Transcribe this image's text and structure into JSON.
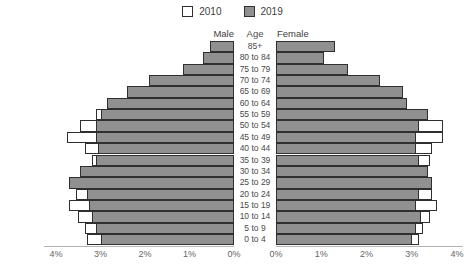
{
  "chart_data": {
    "type": "bar",
    "subtype": "population-pyramid",
    "title": "",
    "unit": "percent of total population",
    "legend": [
      {
        "label": "2010",
        "fill": "#ffffff"
      },
      {
        "label": "2019",
        "fill": "#909090"
      }
    ],
    "column_headers": {
      "male": "Male",
      "age": "Age",
      "female": "Female"
    },
    "categories": [
      "85+",
      "80 to 84",
      "75 to 79",
      "70 to 74",
      "65 to 69",
      "60 to 64",
      "55 to 59",
      "50 to 54",
      "45 to 49",
      "40 to 44",
      "35 to 39",
      "30 to 34",
      "25 to 29",
      "20 to 24",
      "15 to 19",
      "10 to 14",
      "5 to 9",
      "0 to 4"
    ],
    "xlim": [
      0,
      4
    ],
    "male_axis_ticks": [
      "4%",
      "3%",
      "2%",
      "1%",
      "0%"
    ],
    "female_axis_ticks": [
      "0%",
      "1%",
      "2%",
      "3%",
      "4%"
    ],
    "series": [
      {
        "name": "Male 2010",
        "values": [
          0.5,
          0.65,
          1.0,
          1.3,
          1.95,
          2.65,
          3.1,
          3.45,
          3.75,
          3.35,
          3.2,
          3.1,
          3.45,
          3.55,
          3.7,
          3.5,
          3.35,
          3.3
        ]
      },
      {
        "name": "Male 2019",
        "values": [
          0.55,
          0.7,
          1.15,
          1.9,
          2.4,
          2.85,
          3.0,
          3.1,
          3.1,
          3.05,
          3.1,
          3.45,
          3.7,
          3.3,
          3.25,
          3.2,
          3.1,
          3.0
        ]
      },
      {
        "name": "Female 2010",
        "values": [
          1.1,
          1.0,
          1.35,
          1.65,
          2.2,
          2.85,
          3.25,
          3.7,
          3.7,
          3.45,
          3.4,
          3.2,
          3.3,
          3.45,
          3.55,
          3.4,
          3.25,
          3.15
        ]
      },
      {
        "name": "Female 2019",
        "values": [
          1.3,
          1.05,
          1.6,
          2.3,
          2.8,
          2.9,
          3.35,
          3.15,
          3.1,
          3.1,
          3.15,
          3.35,
          3.45,
          3.15,
          3.1,
          3.2,
          3.1,
          3.0
        ]
      }
    ],
    "colors": {
      "fill_2010": "#ffffff",
      "fill_2019": "#909090",
      "stroke": "#2f2f2f"
    },
    "grid": false,
    "legend_position": "top-center"
  }
}
